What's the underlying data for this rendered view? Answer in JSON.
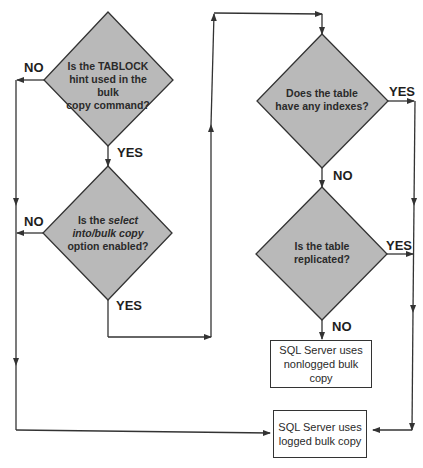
{
  "diagram": {
    "type": "flowchart",
    "colors": {
      "diamond_fill": "#b9b9b9",
      "line": "#333333",
      "background": "#ffffff"
    },
    "decisions": [
      {
        "id": "d1",
        "lines": [
          "Is the TABLOCK",
          "hint used in the bulk",
          "copy command?"
        ],
        "yes_label": "YES",
        "no_label": "NO"
      },
      {
        "id": "d2",
        "line1_prefix": "Is the ",
        "line1_italic": "select",
        "line2_italic": "into/bulk copy",
        "line3": "option enabled?",
        "yes_label": "YES",
        "no_label": "NO"
      },
      {
        "id": "d3",
        "lines": [
          "Does the table",
          "have any indexes?"
        ],
        "yes_label": "YES",
        "no_label": "NO"
      },
      {
        "id": "d4",
        "lines": [
          "Is the table",
          "replicated?"
        ],
        "yes_label": "YES",
        "no_label": "NO"
      }
    ],
    "outcomes": [
      {
        "id": "nonlogged",
        "lines": [
          "SQL Server uses",
          "nonlogged bulk copy"
        ]
      },
      {
        "id": "logged",
        "lines": [
          "SQL Server uses",
          "logged bulk copy"
        ]
      }
    ]
  }
}
